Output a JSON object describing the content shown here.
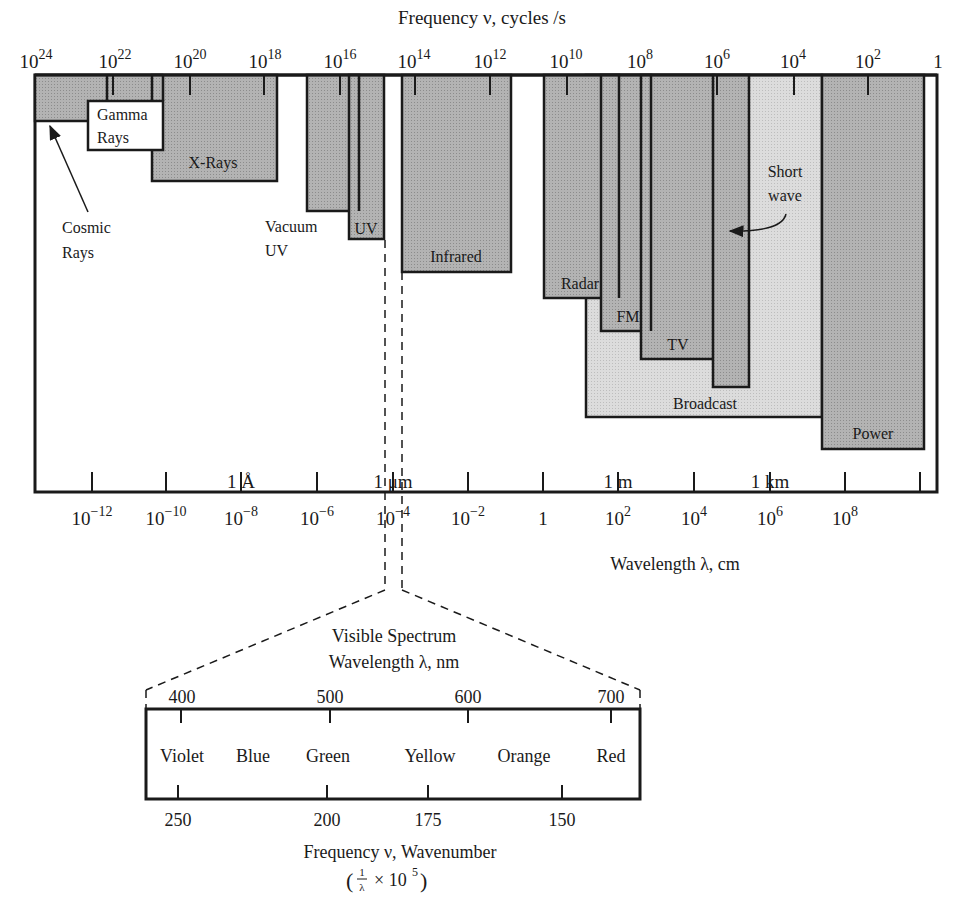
{
  "top_axis": {
    "title": "Frequency ν, cycles /s",
    "ticks": [
      {
        "base": "10",
        "exp": "24",
        "x": 36
      },
      {
        "base": "10",
        "exp": "22",
        "x": 115
      },
      {
        "base": "10",
        "exp": "20",
        "x": 190
      },
      {
        "base": "10",
        "exp": "18",
        "x": 265
      },
      {
        "base": "10",
        "exp": "16",
        "x": 340
      },
      {
        "base": "10",
        "exp": "14",
        "x": 414
      },
      {
        "base": "10",
        "exp": "12",
        "x": 490
      },
      {
        "base": "10",
        "exp": "10",
        "x": 566
      },
      {
        "base": "10",
        "exp": "8",
        "x": 640
      },
      {
        "base": "10",
        "exp": "6",
        "x": 717
      },
      {
        "base": "10",
        "exp": "4",
        "x": 793
      },
      {
        "base": "10",
        "exp": "2",
        "x": 868
      },
      {
        "base": "1",
        "exp": "",
        "x": 938
      }
    ]
  },
  "bottom_axis": {
    "title": "Wavelength λ, cm",
    "ticks": [
      {
        "base": "10",
        "exp": "−12",
        "x": 92
      },
      {
        "base": "10",
        "exp": "−10",
        "x": 166
      },
      {
        "base": "10",
        "exp": "−8",
        "x": 241
      },
      {
        "base": "10",
        "exp": "−6",
        "x": 317
      },
      {
        "base": "10",
        "exp": "−4",
        "x": 393
      },
      {
        "base": "10",
        "exp": "−2",
        "x": 468
      },
      {
        "base": "1",
        "exp": "",
        "x": 543
      },
      {
        "base": "10",
        "exp": "2",
        "x": 618
      },
      {
        "base": "10",
        "exp": "4",
        "x": 694
      },
      {
        "base": "10",
        "exp": "6",
        "x": 770
      },
      {
        "base": "10",
        "exp": "8",
        "x": 845
      },
      {
        "base": "",
        "exp": "",
        "x": 920
      }
    ],
    "unit_labels": [
      {
        "label": "1 Å",
        "x": 241
      },
      {
        "label": "1 μm",
        "x": 393
      },
      {
        "label": "1 m",
        "x": 618
      },
      {
        "label": "1 km",
        "x": 770
      }
    ]
  },
  "bands": [
    {
      "name": "Cosmic Rays",
      "label": "Cosmic\nRays"
    },
    {
      "name": "Gamma Rays",
      "label": "Gamma\nRays"
    },
    {
      "name": "X-Rays",
      "label": "X-Rays"
    },
    {
      "name": "Vacuum UV",
      "label": "Vacuum\nUV"
    },
    {
      "name": "UV",
      "label": "UV"
    },
    {
      "name": "Infrared",
      "label": "Infrared"
    },
    {
      "name": "Radar",
      "label": "Radar"
    },
    {
      "name": "FM",
      "label": "FM"
    },
    {
      "name": "TV",
      "label": "TV"
    },
    {
      "name": "Short wave",
      "label": "Short\nwave"
    },
    {
      "name": "Broadcast",
      "label": "Broadcast"
    },
    {
      "name": "Power",
      "label": "Power"
    }
  ],
  "labels": {
    "cosmic_1": "Cosmic",
    "cosmic_2": "Rays",
    "gamma_1": "Gamma",
    "gamma_2": "Rays",
    "xrays": "X-Rays",
    "vacuum_1": "Vacuum",
    "vacuum_2": "UV",
    "uv": "UV",
    "infrared": "Infrared",
    "radar": "Radar",
    "fm": "FM",
    "tv": "TV",
    "shortwave_1": "Short",
    "shortwave_2": "wave",
    "broadcast": "Broadcast",
    "power": "Power"
  },
  "visible": {
    "title": "Visible Spectrum",
    "wavelength_title": "Wavelength λ, nm",
    "wavelength_ticks": [
      {
        "label": "400",
        "x": 182
      },
      {
        "label": "500",
        "x": 330
      },
      {
        "label": "600",
        "x": 468
      },
      {
        "label": "700",
        "x": 611
      }
    ],
    "colors": [
      {
        "label": "Violet",
        "x": 182
      },
      {
        "label": "Blue",
        "x": 253
      },
      {
        "label": "Green",
        "x": 328
      },
      {
        "label": "Yellow",
        "x": 430
      },
      {
        "label": "Orange",
        "x": 524
      },
      {
        "label": "Red",
        "x": 611
      }
    ],
    "frequency_ticks": [
      {
        "label": "250",
        "x": 178
      },
      {
        "label": "200",
        "x": 327
      },
      {
        "label": "175",
        "x": 428
      },
      {
        "label": "150",
        "x": 562
      }
    ],
    "frequency_title": "Frequency ν, Wavenumber",
    "frequency_formula": "(1/λ × 10⁵)"
  },
  "colors": {
    "dark_fill": "#a9a9a9",
    "light_fill": "#d6d6d6",
    "stroke": "#1a1a1a"
  }
}
